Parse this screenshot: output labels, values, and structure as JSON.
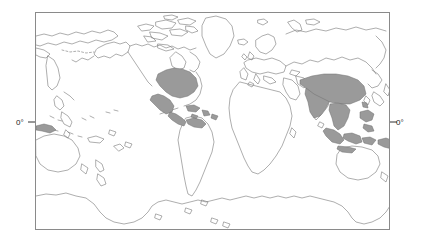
{
  "figure": {
    "kind": "world-distribution-map",
    "projection": "equirectangular",
    "centering": "pacific-centered",
    "background_color": "#ffffff",
    "width": 424,
    "height": 243
  },
  "frame": {
    "x": 35,
    "y": 12,
    "width": 355,
    "height": 218,
    "stroke_color": "#8a8a8a",
    "stroke_width": 1,
    "fill": "#ffffff"
  },
  "axes": {
    "equator_y": 122,
    "left_label": {
      "text": "0°",
      "x": 16,
      "y": 125
    },
    "right_label": {
      "text": "0°",
      "x": 396,
      "y": 125
    },
    "tick_length": 7,
    "tick_color": "#1a1a1a"
  },
  "style": {
    "coastline_color": "#777777",
    "coastline_width": 0.6,
    "shaded_fill": "#9a9a9a",
    "shaded_stroke": "#6e6e6e",
    "land_fill": "none"
  },
  "legend": {
    "shaded_meaning": "distribution range",
    "visible": false
  },
  "regions_shaded": [
    "eastern-and-central-united-states",
    "mexico",
    "central-america",
    "caribbean-islands",
    "northern-south-america",
    "indian-subcontinent",
    "southern-china",
    "southeast-asia-mainland",
    "indonesia",
    "philippines",
    "new-guinea"
  ],
  "regions_unshaded": [
    "alaska",
    "canada",
    "greenland",
    "europe",
    "africa",
    "northern-asia-russia",
    "australia",
    "new-zealand",
    "southern-south-america",
    "antarctica"
  ]
}
